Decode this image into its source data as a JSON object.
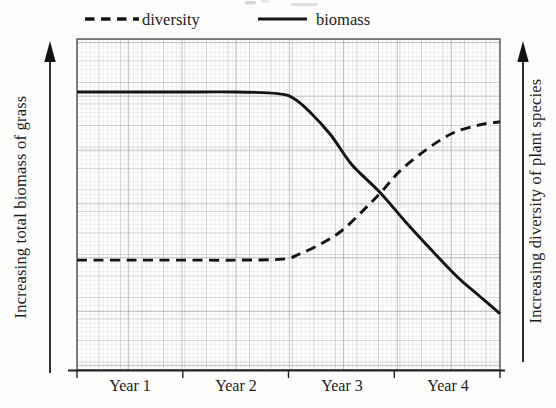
{
  "figure": {
    "legend": {
      "diversity": {
        "label": "diversity",
        "line_style": "dashed"
      },
      "biomass": {
        "label": "biomass",
        "line_style": "solid"
      }
    },
    "left_axis_label": "Increasing total biomass of grass",
    "right_axis_label": "Increasing diversity of plant species",
    "x_tick_labels": [
      "Year 1",
      "Year 2",
      "Year 3",
      "Year 4"
    ],
    "colors": {
      "curve": "#161616",
      "text": "#1c1c1c",
      "grid_fine": "#c6c6c6",
      "grid_mid": "#aeaeae",
      "grid_major": "#8c8c8c",
      "frame": "#444444",
      "background": "#fdfdfc"
    }
  },
  "chart_data": {
    "type": "line",
    "title": "",
    "xlabel_categories": [
      "Year 1",
      "Year 2",
      "Year 3",
      "Year 4"
    ],
    "x_unit": "years",
    "x_range": [
      0,
      4
    ],
    "ylabel_left": "Increasing total biomass of grass",
    "ylabel_right": "Increasing diversity of plant species",
    "y_scale": "qualitative, normalized 0-1 (no numeric ticks shown)",
    "grid": "fine graph-paper grid, on",
    "legend_position": "top",
    "series": [
      {
        "name": "biomass",
        "style": "solid",
        "x": [
          0,
          0.5,
          1,
          1.5,
          1.9,
          2.05,
          2.2,
          2.4,
          2.6,
          2.87,
          3.1,
          3.3,
          3.6,
          3.8,
          4
        ],
        "y": [
          0.84,
          0.84,
          0.84,
          0.84,
          0.835,
          0.82,
          0.78,
          0.71,
          0.62,
          0.535,
          0.45,
          0.38,
          0.28,
          0.225,
          0.17
        ]
      },
      {
        "name": "diversity",
        "style": "dashed",
        "x": [
          0,
          0.5,
          1,
          1.5,
          1.95,
          2.1,
          2.3,
          2.5,
          2.7,
          2.87,
          3.05,
          3.3,
          3.55,
          3.8,
          4
        ],
        "y": [
          0.332,
          0.332,
          0.332,
          0.332,
          0.335,
          0.35,
          0.38,
          0.42,
          0.48,
          0.535,
          0.6,
          0.665,
          0.715,
          0.74,
          0.75
        ]
      }
    ],
    "annotations": {
      "curves_cross_at": {
        "x_years": 2.87,
        "y_normalized": 0.535
      }
    }
  }
}
